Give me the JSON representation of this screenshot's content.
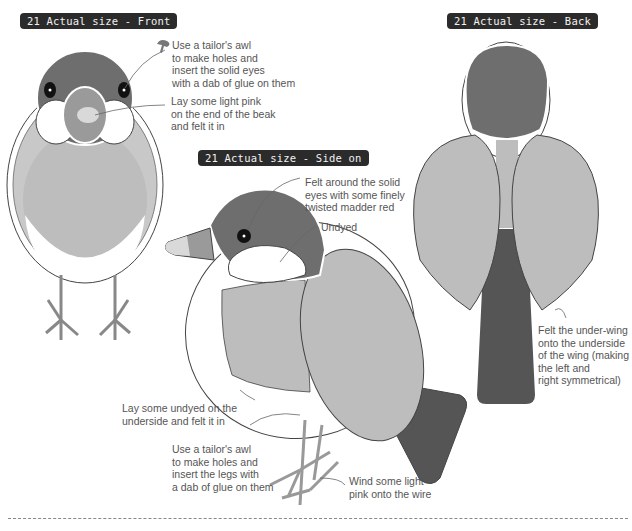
{
  "titles": {
    "front": "21 Actual size - Front",
    "side": "21 Actual size - Side on",
    "back": "21 Actual size - Back"
  },
  "notes": {
    "eyes_front": "Use a tailor's awl\nto make holes and\ninsert the solid eyes\nwith a dab of glue on them",
    "beak_pink": "Lay some light pink\non the end of the beak\nand felt it in",
    "felt_around_eyes": "Felt around the solid\neyes with some finely\ntwisted madder red",
    "undyed": "Undyed",
    "under_wing": "Felt the under-wing\nonto the underside\nof the wing (making\nthe left and\nright symmetrical)",
    "underside": "Lay some undyed on the\nunderside and felt it in",
    "legs": "Use a tailor's awl\nto make holes and\ninsert the legs with\na dab of glue on them",
    "wire": "Wind some light\npink onto the wire"
  },
  "colors": {
    "badge_bg": "#2b2b2b",
    "head_dark": "#6e6e6e",
    "body_light": "#bdbdbd",
    "beak": "#9a9a9a",
    "pink": "#d9d9d9",
    "outline": "#444444"
  }
}
